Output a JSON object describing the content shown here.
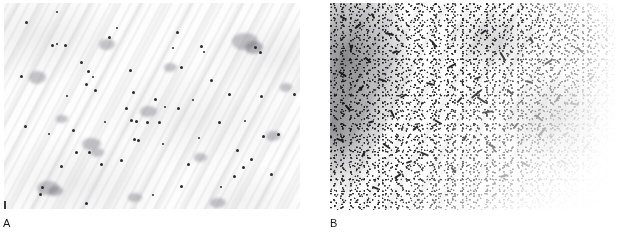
{
  "figure": {
    "type": "two-panel-micrograph",
    "background_color": "#ffffff",
    "panels": [
      {
        "id": "A",
        "caption": "A",
        "content": "Sparse scattered punctate dark particles on a pale, faintly striated background",
        "field_appearance": "pale / near-white background with diagonal smear striations",
        "particle_density": "sparse",
        "particle_shape": "punctate dots",
        "particle_color": "#2b2b2f",
        "background_color": "#fdfdfd",
        "x": 4,
        "y": 3,
        "width": 296,
        "height": 206
      },
      {
        "id": "B",
        "caption": "B",
        "content": "Dense field of rod-shaped bacilli, heaviest in the upper-left, fading diagonally toward the lower-right",
        "field_appearance": "dense dark bacilli with diagonal density gradient",
        "particle_density": "dense",
        "particle_shape": "rods / bacilli",
        "particle_color": "#262629",
        "background_color": "#fdfdfd",
        "x": 330,
        "y": 3,
        "width": 285,
        "height": 207
      }
    ]
  },
  "labels": {
    "panel_a": "A",
    "panel_b": "B"
  },
  "colors": {
    "page_background": "#ffffff",
    "slide_background": "#fdfdfd",
    "particle_dark": "#262629",
    "caption_text": "#1a1a1a",
    "striation_gray": "#a8a8ae"
  }
}
